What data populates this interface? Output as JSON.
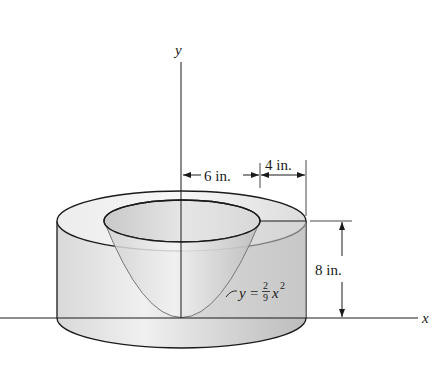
{
  "figure": {
    "axes": {
      "x_label": "x",
      "y_label": "y"
    },
    "dimensions": {
      "inner_radius": "6 in.",
      "wall_thickness": "4 in.",
      "height": "8 in."
    },
    "equation": {
      "lhs": "y",
      "eq": "=",
      "num": "2",
      "den": "9",
      "var": "x",
      "exp": "2"
    },
    "colors": {
      "line": "#1a1a1a",
      "fill_light": "#efefef",
      "fill_mid": "#d4d4d4",
      "fill_dark": "#bdbdbd"
    }
  }
}
